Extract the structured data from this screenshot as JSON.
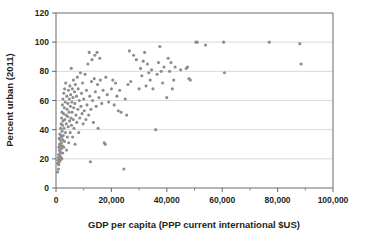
{
  "chart_data": {
    "type": "scatter",
    "title": "",
    "subtitle": "",
    "xlabel": "GDP per capita (PPP current international $US)",
    "ylabel": "Percent urban (2011)",
    "xlim": [
      0,
      100000
    ],
    "ylim": [
      0,
      120
    ],
    "xticks": [
      0,
      20000,
      40000,
      60000,
      80000,
      100000
    ],
    "xticklabels": [
      "0",
      "20,000",
      "40,000",
      "60,000",
      "80,000",
      "100,000"
    ],
    "xminorticks": [
      10000,
      30000,
      50000,
      70000,
      90000
    ],
    "yticks": [
      0,
      20,
      40,
      60,
      80,
      100,
      120
    ],
    "yticklabels": [
      "0",
      "20",
      "40",
      "60",
      "80",
      "100",
      "120"
    ],
    "grid": "horizontal-major-only",
    "legend": "none",
    "marker_color": "#8d8d8d",
    "marker_size_px": 3.1,
    "n_points": 184,
    "points": [
      [
        600,
        11
      ],
      [
        700,
        17
      ],
      [
        800,
        19
      ],
      [
        900,
        13
      ],
      [
        950,
        21
      ],
      [
        1000,
        16
      ],
      [
        1000,
        23
      ],
      [
        1050,
        28
      ],
      [
        1100,
        20
      ],
      [
        1150,
        34
      ],
      [
        1200,
        18
      ],
      [
        1250,
        26
      ],
      [
        1300,
        30
      ],
      [
        1350,
        22
      ],
      [
        1400,
        37
      ],
      [
        1450,
        25
      ],
      [
        1500,
        19
      ],
      [
        1550,
        33
      ],
      [
        1600,
        29
      ],
      [
        1650,
        41
      ],
      [
        1700,
        24
      ],
      [
        1750,
        36
      ],
      [
        1800,
        21
      ],
      [
        1850,
        44
      ],
      [
        1900,
        31
      ],
      [
        1950,
        27
      ],
      [
        2000,
        48
      ],
      [
        2050,
        35
      ],
      [
        2100,
        20
      ],
      [
        2150,
        52
      ],
      [
        2200,
        39
      ],
      [
        2250,
        29
      ],
      [
        2300,
        57
      ],
      [
        2350,
        43
      ],
      [
        2400,
        33
      ],
      [
        2450,
        24
      ],
      [
        2500,
        61
      ],
      [
        2550,
        46
      ],
      [
        2600,
        36
      ],
      [
        2700,
        51
      ],
      [
        2750,
        28
      ],
      [
        2800,
        65
      ],
      [
        2900,
        41
      ],
      [
        3000,
        55
      ],
      [
        3050,
        32
      ],
      [
        3100,
        68
      ],
      [
        3200,
        47
      ],
      [
        3300,
        59
      ],
      [
        3400,
        38
      ],
      [
        3500,
        72
      ],
      [
        3600,
        50
      ],
      [
        3700,
        44
      ],
      [
        3800,
        26
      ],
      [
        3900,
        63
      ],
      [
        4000,
        54
      ],
      [
        4100,
        35
      ],
      [
        4200,
        49
      ],
      [
        4300,
        58
      ],
      [
        4400,
        42
      ],
      [
        4500,
        67
      ],
      [
        4600,
        31
      ],
      [
        4700,
        52
      ],
      [
        4800,
        61
      ],
      [
        4900,
        46
      ],
      [
        5000,
        70
      ],
      [
        5100,
        38
      ],
      [
        5200,
        56
      ],
      [
        5300,
        64
      ],
      [
        5400,
        48
      ],
      [
        5500,
        82
      ],
      [
        5600,
        43
      ],
      [
        5700,
        59
      ],
      [
        5800,
        52
      ],
      [
        5900,
        68
      ],
      [
        6000,
        35
      ],
      [
        6100,
        62
      ],
      [
        6200,
        47
      ],
      [
        6300,
        74
      ],
      [
        6400,
        55
      ],
      [
        6500,
        41
      ],
      [
        6700,
        66
      ],
      [
        6800,
        58
      ],
      [
        6900,
        30
      ],
      [
        7000,
        71
      ],
      [
        7200,
        50
      ],
      [
        7400,
        63
      ],
      [
        7500,
        45
      ],
      [
        7700,
        76
      ],
      [
        7900,
        54
      ],
      [
        8000,
        68
      ],
      [
        8200,
        38
      ],
      [
        8400,
        60
      ],
      [
        8600,
        48
      ],
      [
        8800,
        79
      ],
      [
        9000,
        56
      ],
      [
        9200,
        65
      ],
      [
        9400,
        51
      ],
      [
        9600,
        72
      ],
      [
        9800,
        44
      ],
      [
        10000,
        61
      ],
      [
        10200,
        53
      ],
      [
        10500,
        78
      ],
      [
        10800,
        47
      ],
      [
        11000,
        67
      ],
      [
        11200,
        57
      ],
      [
        11500,
        85
      ],
      [
        11800,
        50
      ],
      [
        12000,
        93
      ],
      [
        12200,
        63
      ],
      [
        12400,
        18
      ],
      [
        12600,
        54
      ],
      [
        12800,
        73
      ],
      [
        13000,
        88
      ],
      [
        13200,
        60
      ],
      [
        13500,
        45
      ],
      [
        13800,
        75
      ],
      [
        14000,
        91
      ],
      [
        14200,
        66
      ],
      [
        14500,
        56
      ],
      [
        14800,
        93
      ],
      [
        15000,
        71
      ],
      [
        15200,
        41
      ],
      [
        15500,
        62
      ],
      [
        15800,
        89
      ],
      [
        16000,
        74
      ],
      [
        16500,
        58
      ],
      [
        17000,
        67
      ],
      [
        17400,
        31
      ],
      [
        17800,
        30
      ],
      [
        18000,
        76
      ],
      [
        18500,
        64
      ],
      [
        19000,
        59
      ],
      [
        20000,
        68
      ],
      [
        20500,
        74
      ],
      [
        21000,
        57
      ],
      [
        21500,
        72
      ],
      [
        22000,
        63
      ],
      [
        22500,
        53
      ],
      [
        23000,
        67
      ],
      [
        23500,
        52
      ],
      [
        24500,
        13
      ],
      [
        25000,
        61
      ],
      [
        25500,
        50
      ],
      [
        26000,
        71
      ],
      [
        26500,
        94
      ],
      [
        27000,
        73
      ],
      [
        28000,
        91
      ],
      [
        29000,
        88
      ],
      [
        30000,
        68
      ],
      [
        30500,
        82
      ],
      [
        31000,
        77
      ],
      [
        31500,
        87
      ],
      [
        32000,
        93
      ],
      [
        32500,
        70
      ],
      [
        33000,
        85
      ],
      [
        33500,
        79
      ],
      [
        34000,
        74
      ],
      [
        34500,
        81
      ],
      [
        35000,
        68
      ],
      [
        36000,
        40
      ],
      [
        36500,
        78
      ],
      [
        37000,
        86
      ],
      [
        37500,
        97
      ],
      [
        38000,
        80
      ],
      [
        38500,
        72
      ],
      [
        39000,
        83
      ],
      [
        40000,
        62
      ],
      [
        40500,
        89
      ],
      [
        41000,
        80
      ],
      [
        41500,
        86
      ],
      [
        42000,
        68
      ],
      [
        42500,
        74
      ],
      [
        43000,
        83
      ],
      [
        45000,
        81
      ],
      [
        47000,
        82
      ],
      [
        47500,
        83
      ],
      [
        48000,
        75
      ],
      [
        48500,
        74
      ],
      [
        50500,
        100
      ],
      [
        51000,
        100
      ],
      [
        54000,
        98
      ],
      [
        60500,
        100
      ],
      [
        60800,
        79
      ],
      [
        77000,
        100
      ],
      [
        88000,
        99
      ],
      [
        88500,
        85
      ]
    ]
  }
}
